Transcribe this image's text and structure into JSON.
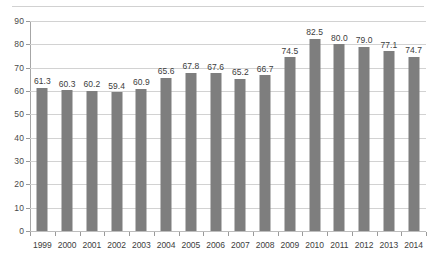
{
  "chart_data": {
    "type": "bar",
    "title": "",
    "subtitle": "",
    "xlabel": "",
    "ylabel": "",
    "categories": [
      "1999",
      "2000",
      "2001",
      "2002",
      "2003",
      "2004",
      "2005",
      "2006",
      "2007",
      "2008",
      "2009",
      "2010",
      "2011",
      "2012",
      "2013",
      "2014"
    ],
    "values": [
      61.3,
      60.3,
      60.2,
      59.4,
      60.9,
      65.6,
      67.8,
      67.6,
      65.2,
      66.7,
      74.5,
      82.5,
      80.0,
      79.0,
      77.1,
      74.7
    ],
    "data_labels": [
      "61.3",
      "60.3",
      "60.2",
      "59.4",
      "60.9",
      "65.6",
      "67.8",
      "67.6",
      "65.2",
      "66.7",
      "74.5",
      "82.5",
      "80.0",
      "79.0",
      "77.1",
      "74.7"
    ],
    "ylim": [
      0,
      90
    ],
    "ytick_values": [
      0,
      10,
      20,
      30,
      40,
      50,
      60,
      70,
      80,
      90
    ],
    "ytick_labels": [
      "0",
      "10",
      "20",
      "30",
      "40",
      "50",
      "60",
      "70",
      "80",
      "90"
    ],
    "grid": true,
    "grid_axis": "y",
    "legend": false,
    "legend_position": "none",
    "series": [
      {
        "name": "",
        "values": [
          61.3,
          60.3,
          60.2,
          59.4,
          60.9,
          65.6,
          67.8,
          67.6,
          65.2,
          66.7,
          74.5,
          82.5,
          80.0,
          79.0,
          77.1,
          74.7
        ]
      }
    ],
    "colors": {
      "bar": "#7e7e7e",
      "gridline": "#d2d2d2",
      "axis": "#a6a6a6",
      "label_text": "#3d3d3d",
      "background": "#ffffff"
    }
  }
}
